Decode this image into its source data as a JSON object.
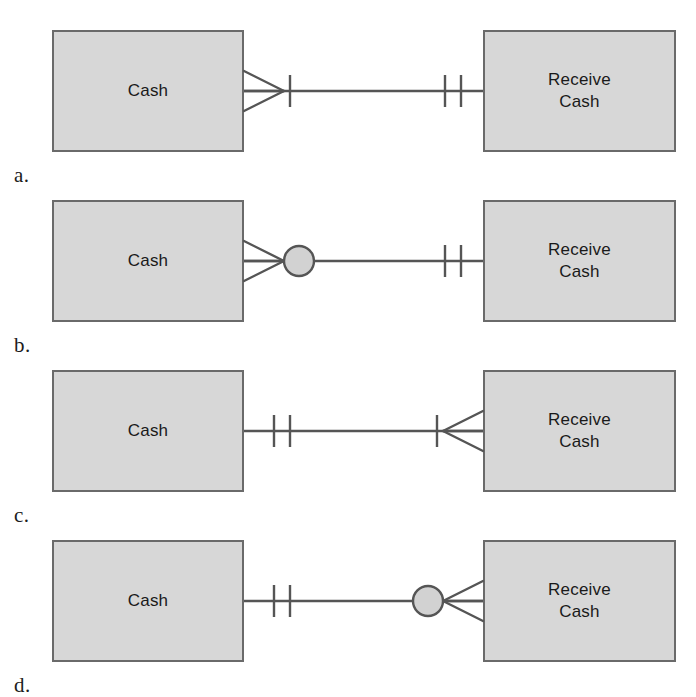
{
  "figure": {
    "notation": "crow's-foot-entity-relationship",
    "background_color": "#ffffff",
    "box_fill_color": "#d7d7d7",
    "box_border_color": "#6a6a6a",
    "line_color": "#555555",
    "text_color": "#1a1a1a"
  },
  "entities": {
    "left_label": "Cash",
    "right_label": "Receive\nCash"
  },
  "rows": [
    {
      "label": "a.",
      "left_entity": "Cash",
      "right_entity": "Receive\nCash",
      "left_end": {
        "symbol": "crow-foot-one",
        "crow_foot": true,
        "circle": false,
        "ticks": 1
      },
      "right_end": {
        "symbol": "one-and-only-one",
        "crow_foot": false,
        "circle": false,
        "ticks": 2
      }
    },
    {
      "label": "b.",
      "left_entity": "Cash",
      "right_entity": "Receive\nCash",
      "left_end": {
        "symbol": "zero-or-many",
        "crow_foot": true,
        "circle": true,
        "ticks": 0
      },
      "right_end": {
        "symbol": "one-and-only-one",
        "crow_foot": false,
        "circle": false,
        "ticks": 2
      }
    },
    {
      "label": "c.",
      "left_entity": "Cash",
      "right_entity": "Receive\nCash",
      "left_end": {
        "symbol": "one-and-only-one",
        "crow_foot": false,
        "circle": false,
        "ticks": 2
      },
      "right_end": {
        "symbol": "crow-foot-one",
        "crow_foot": true,
        "circle": false,
        "ticks": 1
      }
    },
    {
      "label": "d.",
      "left_entity": "Cash",
      "right_entity": "Receive\nCash",
      "left_end": {
        "symbol": "one-and-only-one",
        "crow_foot": false,
        "circle": false,
        "ticks": 2
      },
      "right_end": {
        "symbol": "zero-or-many",
        "crow_foot": true,
        "circle": true,
        "ticks": 0
      }
    }
  ],
  "geometry": {
    "row_tops": [
      20,
      190,
      360,
      530
    ],
    "box_top": 10,
    "box_height": 122,
    "left_box_x": 52,
    "left_box_width": 192,
    "right_box_x": 483,
    "right_box_width": 193,
    "line_y": 71
  }
}
